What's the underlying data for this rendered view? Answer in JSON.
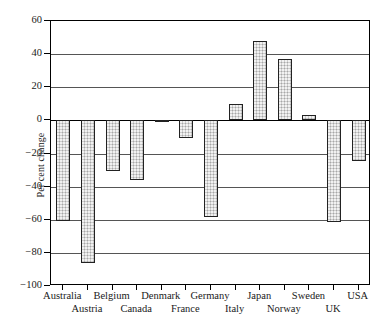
{
  "chart_data": {
    "type": "bar",
    "title": "",
    "subtitle": "",
    "xlabel": "",
    "ylabel": "Per cent change",
    "ylim": [
      -100,
      60
    ],
    "ytick_step": 20,
    "yticks": [
      60,
      40,
      20,
      0,
      -20,
      -40,
      -60,
      -80,
      -100
    ],
    "ytick_labels": [
      "60",
      "40",
      "20",
      "0",
      "−20",
      "−40",
      "−60",
      "−80",
      "−100"
    ],
    "grid": "horizontal",
    "legend": "none",
    "bar_fill_color": "#cdcdcd",
    "bar_edge_color": "#222222",
    "axis_color": "#000000",
    "background_color": "#ffffff",
    "categories": [
      "Australia",
      "Austria",
      "Belgium",
      "Canada",
      "Denmark",
      "France",
      "Germany",
      "Italy",
      "Japan",
      "Norway",
      "Sweden",
      "UK",
      "USA"
    ],
    "values": [
      -60.5,
      -86.0,
      -30.5,
      -36.0,
      -1.0,
      -10.5,
      -58.5,
      10.0,
      48.0,
      37.0,
      3.0,
      -61.5,
      -24.5
    ],
    "category_label_rows": [
      0,
      1,
      0,
      1,
      0,
      1,
      0,
      1,
      0,
      1,
      0,
      1,
      0
    ],
    "annotations": []
  }
}
